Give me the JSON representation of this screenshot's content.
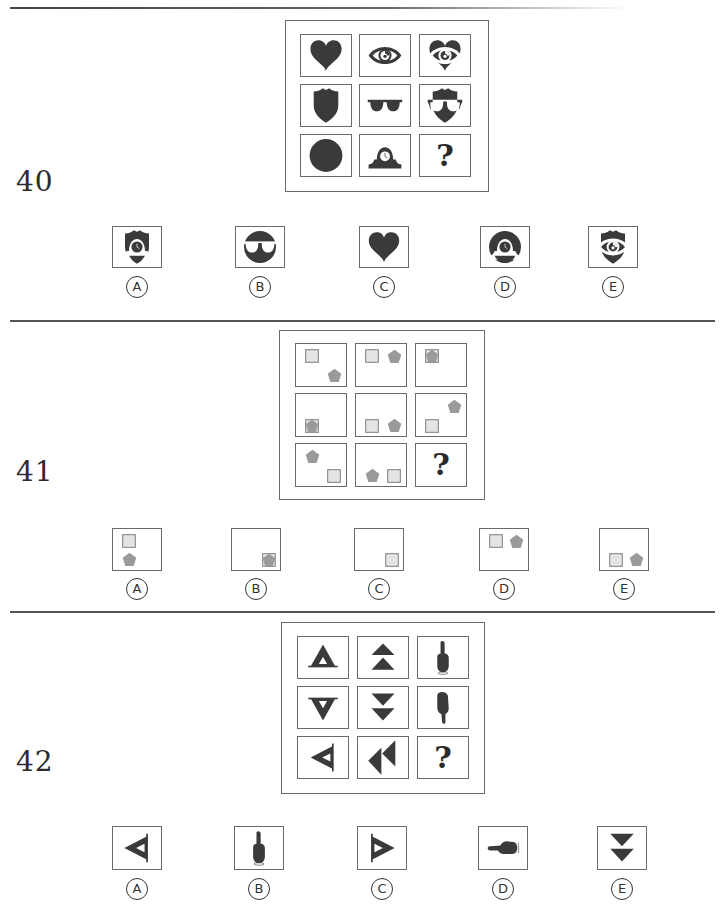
{
  "colors": {
    "ink": "#3a3a3a",
    "gray_shape": "#9a9a9a",
    "light_square": "#e4e4e4",
    "border": "#6a6a6a"
  },
  "questions": [
    {
      "number": "40",
      "grid": [
        [
          "heart-icon",
          "eye-icon",
          "heart-eye-overlay-icon"
        ],
        [
          "shield-icon",
          "sunglasses-icon",
          "shield-sunglasses-overlay-icon"
        ],
        [
          "circle-icon",
          "mantel-clock-icon",
          "?"
        ]
      ],
      "question_mark": "?",
      "options": [
        {
          "label": "A",
          "icon": "shield-clock-overlay-icon"
        },
        {
          "label": "B",
          "icon": "circle-sunglasses-overlay-icon"
        },
        {
          "label": "C",
          "icon": "heart-icon"
        },
        {
          "label": "D",
          "icon": "circle-clock-overlay-icon"
        },
        {
          "label": "E",
          "icon": "shield-eye-overlay-icon"
        }
      ]
    },
    {
      "number": "41",
      "grid": [
        [
          "square top-left, pentagon bottom-right",
          "square top-left, pentagon top-right",
          "square+pentagon overlap top-left"
        ],
        [
          "square+pentagon overlap bottom-left",
          "square bottom-left, pentagon bottom-right",
          "square bottom-left, pentagon top-right"
        ],
        [
          "pentagon top-left, square bottom-right",
          "pentagon bottom-left, square bottom-right",
          "?"
        ]
      ],
      "question_mark": "?",
      "options": [
        {
          "label": "A",
          "icon": "square top-left, pentagon bottom-left"
        },
        {
          "label": "B",
          "icon": "square+pentagon overlap bottom-right"
        },
        {
          "label": "C",
          "icon": "square bottom-right"
        },
        {
          "label": "D",
          "icon": "square top-left, pentagon top-right"
        },
        {
          "label": "E",
          "icon": "square bottom-left, pentagon bottom-right"
        }
      ]
    },
    {
      "number": "42",
      "grid": [
        [
          "hollow-triangle-up-icon",
          "double-triangle-up-icon",
          "hand-pointing-up-icon"
        ],
        [
          "hollow-triangle-down-icon",
          "double-triangle-down-icon",
          "hand-pointing-down-icon"
        ],
        [
          "hollow-triangle-left-icon",
          "double-triangle-left-icon",
          "?"
        ]
      ],
      "question_mark": "?",
      "options": [
        {
          "label": "A",
          "icon": "hollow-triangle-left-icon"
        },
        {
          "label": "B",
          "icon": "hand-pointing-up-icon"
        },
        {
          "label": "C",
          "icon": "hollow-triangle-right-icon"
        },
        {
          "label": "D",
          "icon": "hand-pointing-left-icon"
        },
        {
          "label": "E",
          "icon": "double-triangle-down-icon"
        }
      ]
    }
  ],
  "option_labels": [
    "Ⓐ",
    "Ⓑ",
    "Ⓒ",
    "Ⓓ",
    "Ⓔ"
  ]
}
